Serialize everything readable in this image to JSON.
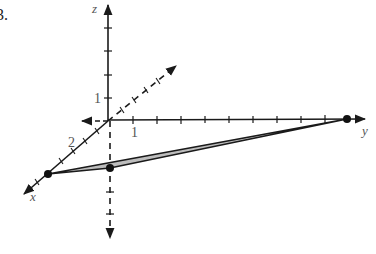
{
  "problem_number": "3.",
  "axes": {
    "x_label": "x",
    "y_label": "y",
    "z_label": "z"
  },
  "tick_labels": {
    "z_one": "1",
    "y_one": "1",
    "x_two": "2"
  },
  "points": [
    {
      "name": "point-on-x-axis",
      "px": [
        48,
        174
      ]
    },
    {
      "name": "point-below-origin",
      "px": [
        110,
        168
      ]
    },
    {
      "name": "point-on-y-axis",
      "px": [
        347,
        119
      ]
    }
  ],
  "colors": {
    "line": "#1a1a1a",
    "triangle_fill": "#bdbdbd",
    "label": "#555555"
  }
}
